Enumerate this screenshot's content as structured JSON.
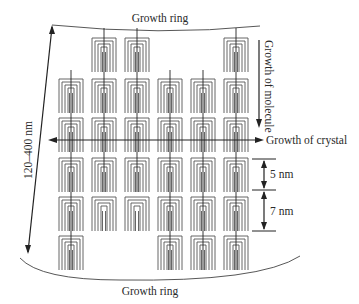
{
  "labels": {
    "top_ring": "Growth ring",
    "bottom_ring": "Growth ring",
    "molecule_growth": "Growth of molecule",
    "crystal_growth": "Growth of crystal",
    "thickness_range": "120–400 nm",
    "spacing_small": "5 nm",
    "spacing_large": "7 nm"
  },
  "grid": {
    "columns": [
      71,
      104,
      137,
      170,
      203,
      236
    ],
    "rows": [
      38,
      79,
      118,
      158,
      197,
      236
    ],
    "block_width": 24,
    "block_height": 34,
    "present": [
      [
        1,
        2,
        5
      ],
      [
        0,
        1,
        2,
        3,
        4,
        5
      ],
      [
        0,
        1,
        2,
        3,
        4,
        5
      ],
      [
        0,
        1,
        2,
        3,
        4,
        5
      ],
      [
        0,
        1,
        2,
        3,
        4,
        5
      ],
      [
        0,
        3,
        4,
        5
      ]
    ],
    "molecule_lines": [
      {
        "col": 0,
        "y1": 70,
        "y2": 270
      },
      {
        "col": 1,
        "y1": 28,
        "y2": 192
      },
      {
        "col": 2,
        "y1": 28,
        "y2": 192
      },
      {
        "col": 3,
        "y1": 70,
        "y2": 270
      },
      {
        "col": 4,
        "y1": 70,
        "y2": 270
      },
      {
        "col": 5,
        "y1": 28,
        "y2": 270
      }
    ]
  },
  "colors": {
    "line": "#555555",
    "arrow": "#222222",
    "text": "#2a2a2a"
  }
}
